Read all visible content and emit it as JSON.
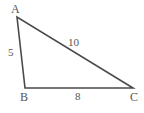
{
  "figure": {
    "type": "triangle-diagram",
    "background_color": "#ffffff",
    "stroke_color": "#4a4a4a",
    "text_color": "#555555",
    "vertices": {
      "A": {
        "label": "A",
        "x": 17,
        "y": 17
      },
      "B": {
        "label": "B",
        "x": 25,
        "y": 88
      },
      "C": {
        "label": "C",
        "x": 133,
        "y": 88
      }
    },
    "sides": {
      "AB": {
        "label": "5",
        "value": 5
      },
      "AC": {
        "label": "10",
        "value": 10
      },
      "BC": {
        "label": "8",
        "value": 8
      }
    }
  },
  "chart_data": {
    "type": "diagram",
    "title": "",
    "shape": "triangle",
    "vertex_labels": [
      "A",
      "B",
      "C"
    ],
    "vertex_points": [
      [
        17,
        17
      ],
      [
        25,
        88
      ],
      [
        133,
        88
      ]
    ],
    "edges": [
      {
        "from": "A",
        "to": "B",
        "length_label": "5"
      },
      {
        "from": "A",
        "to": "C",
        "length_label": "10"
      },
      {
        "from": "B",
        "to": "C",
        "length_label": "8"
      }
    ],
    "side_lengths": [
      5,
      10,
      8
    ],
    "xlabel": "",
    "ylabel": ""
  }
}
